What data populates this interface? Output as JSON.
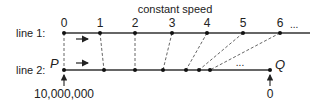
{
  "title": "constant speed",
  "line1": {
    "label": "line 1:",
    "ticks": [
      {
        "label": "0",
        "x": 64
      },
      {
        "label": "1",
        "x": 100
      },
      {
        "label": "2",
        "x": 135
      },
      {
        "label": "3",
        "x": 172
      },
      {
        "label": "4",
        "x": 207
      },
      {
        "label": "5",
        "x": 243
      },
      {
        "label": "6",
        "x": 280
      }
    ],
    "ellipsis": "...",
    "y": 33,
    "x_end": 310
  },
  "line2": {
    "label": "line 2:",
    "start_point": "P",
    "end_point": "Q",
    "dots": [
      64,
      104,
      135,
      163,
      186,
      199,
      210
    ],
    "ellipsis": "...",
    "y": 70,
    "x_end": 270
  },
  "annotations": {
    "p_value": "10,000,000",
    "q_value": "0"
  },
  "colors": {
    "line": "#333333",
    "dash": "#555555",
    "text": "#222222"
  }
}
